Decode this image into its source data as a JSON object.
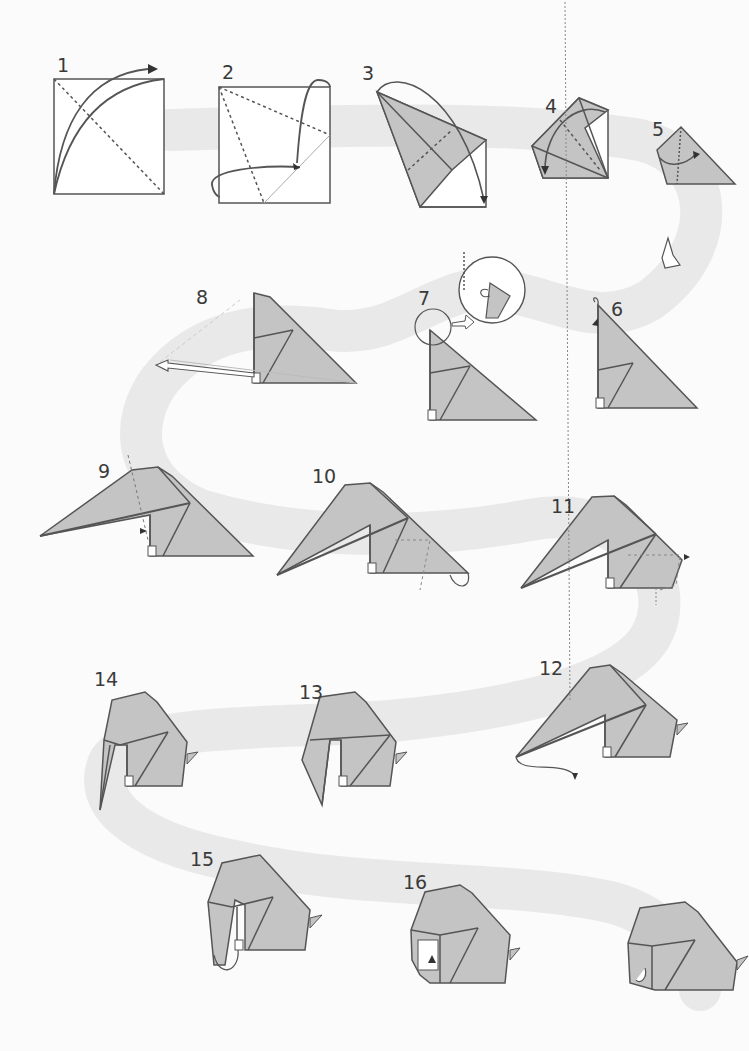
{
  "diagram": {
    "type": "origami-instructions",
    "colors": {
      "paper_color": "#c4c4c4",
      "line_color": "#555555",
      "path_band": "#e6e6e6",
      "background": "#fbfbfb"
    },
    "steps": [
      {
        "number": "1",
        "label": "1"
      },
      {
        "number": "2",
        "label": "2"
      },
      {
        "number": "3",
        "label": "3"
      },
      {
        "number": "4",
        "label": "4"
      },
      {
        "number": "5",
        "label": "5"
      },
      {
        "number": "6",
        "label": "6"
      },
      {
        "number": "7",
        "label": "7"
      },
      {
        "number": "8",
        "label": "8"
      },
      {
        "number": "9",
        "label": "9"
      },
      {
        "number": "10",
        "label": "10"
      },
      {
        "number": "11",
        "label": "11"
      },
      {
        "number": "12",
        "label": "12"
      },
      {
        "number": "13",
        "label": "13"
      },
      {
        "number": "14",
        "label": "14"
      },
      {
        "number": "15",
        "label": "15"
      },
      {
        "number": "16",
        "label": "16"
      }
    ],
    "final_result": {
      "label": ""
    }
  }
}
